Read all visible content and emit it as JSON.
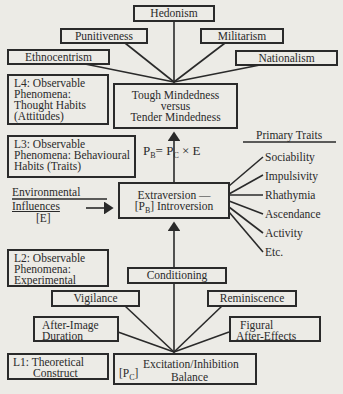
{
  "diagram": {
    "attitudes": {
      "hedonism": "Hedonism",
      "punitiveness": "Punitiveness",
      "militarism": "Militarism",
      "ethnocentrism": "Ethnocentrism",
      "nationalism": "Nationalism"
    },
    "levels": {
      "l4": {
        "label": "L4: Observable",
        "line2": "Phenomena:",
        "line3": "Thought Habits",
        "line4": "(Attitudes)"
      },
      "l3": {
        "label": "L3: Observable",
        "line2": "Phenomena: Behavioural",
        "line3": "Habits (Traits)"
      },
      "l2": {
        "label": "L2: Observable",
        "line2": "Phenomena:",
        "line3": "Experimental"
      },
      "l1": {
        "label": "L1: Theoretical",
        "line2": "Construct"
      }
    },
    "tough": {
      "line1": "Tough Mindedness",
      "line2": "versus",
      "line3": "Tender Mindedness"
    },
    "formula": {
      "lhs": "P",
      "lhs_sub": "B",
      "eq": "= P",
      "rhs_sub": "C",
      "rest": " × E"
    },
    "primary_traits": {
      "title": "Primary Traits",
      "items": [
        "Sociability",
        "Impulsivity",
        "Rhathymia",
        "Ascendance",
        "Activity",
        "Etc."
      ]
    },
    "extraversion": {
      "line1": "Extraversion —",
      "prefix": "[P",
      "prefix_sub": "B",
      "line2": "] Introversion"
    },
    "environment": {
      "line1": "Environmental",
      "line2": "Influences",
      "line3": "[E]"
    },
    "experimental": {
      "conditioning": "Conditioning",
      "vigilance": "Vigilance",
      "reminiscence": "Reminiscence",
      "after_image": {
        "line1": "After-Image",
        "line2": "Duration"
      },
      "figural": {
        "line1": "Figural",
        "line2": "After-Effects"
      }
    },
    "excitation": {
      "prefix": "[P",
      "prefix_sub": "C",
      "prefix_end": "]",
      "line1": "Excitation/Inhibition",
      "line2": "Balance"
    }
  }
}
